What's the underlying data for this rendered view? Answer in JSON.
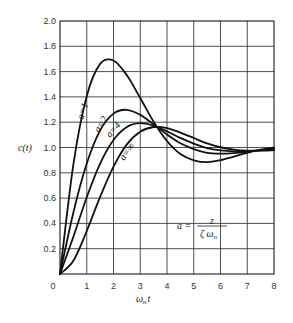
{
  "chart_data": {
    "type": "line",
    "title": "",
    "xlabel": "ωn t",
    "ylabel": "c(t)",
    "xlim": [
      0,
      8
    ],
    "ylim": [
      0,
      2.0
    ],
    "grid": true,
    "x_ticks": [
      "0",
      "1",
      "2",
      "3",
      "4",
      "5",
      "6",
      "7",
      "8"
    ],
    "y_ticks": [
      "0.2",
      "0.4",
      "0.6",
      "0.8",
      "1.0",
      "1.2",
      "1.4",
      "1.6",
      "1.8",
      "2.0"
    ],
    "x": [
      0,
      0.5,
      1.0,
      1.5,
      2.0,
      2.5,
      3.0,
      3.5,
      4.0,
      4.5,
      5.0,
      5.5,
      6.0,
      6.5,
      7.0,
      7.5,
      8.0
    ],
    "series": [
      {
        "name": "a = 1",
        "values": [
          0,
          0.867,
          1.407,
          1.661,
          1.688,
          1.571,
          1.391,
          1.204,
          1.051,
          0.948,
          0.899,
          0.884,
          0.9,
          0.928,
          0.958,
          0.983,
          1.001
        ]
      },
      {
        "name": "a = 2",
        "values": [
          0,
          0.486,
          0.873,
          1.135,
          1.268,
          1.298,
          1.258,
          1.183,
          1.102,
          1.033,
          0.987,
          0.958,
          0.952,
          0.956,
          0.966,
          0.979,
          0.99
        ]
      },
      {
        "name": "a = 4",
        "values": [
          0,
          0.295,
          0.607,
          0.873,
          1.059,
          1.162,
          1.192,
          1.172,
          1.128,
          1.076,
          1.031,
          0.995,
          0.977,
          0.97,
          0.971,
          0.977,
          0.984
        ]
      },
      {
        "name": "a = ∞",
        "values": [
          0,
          0.104,
          0.34,
          0.61,
          0.849,
          1.025,
          1.125,
          1.162,
          1.154,
          1.118,
          1.075,
          1.032,
          1.002,
          0.984,
          0.975,
          0.975,
          0.979
        ]
      }
    ],
    "annotations": [
      {
        "text": "a = z / (ζ ωn)",
        "position": "lower-right inside plot"
      },
      {
        "text": "a=1",
        "on_series": "a = 1"
      },
      {
        "text": "a=2",
        "on_series": "a = 2"
      },
      {
        "text": "a=4",
        "on_series": "a = 4"
      },
      {
        "text": "a=∞",
        "on_series": "a = ∞"
      }
    ],
    "legend_position": "none (inline labels)"
  },
  "labels": {
    "y_axis": "c(t)",
    "x_axis_main": "ω",
    "x_axis_sub": "n",
    "x_axis_tail": "t",
    "origin": "0",
    "formula_lhs": "a =",
    "formula_num": "z",
    "formula_den_main": "ζ ω",
    "formula_den_sub": "n",
    "curve_a1": "a=1",
    "curve_a2": "a=2",
    "curve_a4": "a=4",
    "curve_ainf": "a=∞"
  }
}
